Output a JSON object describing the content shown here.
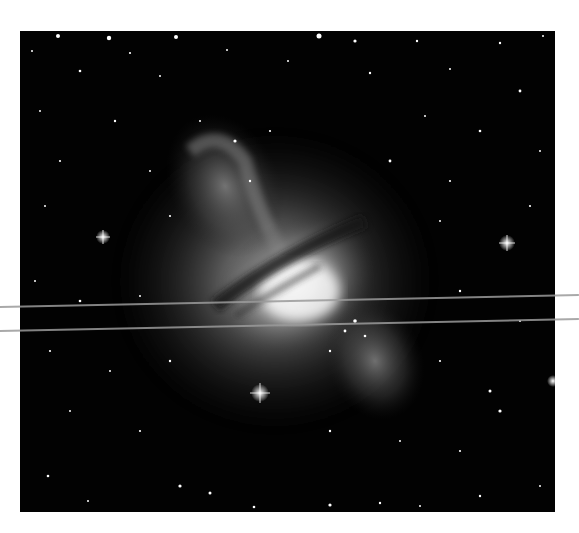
{
  "image": {
    "subject": "Centaurus A galaxy (NGC 5128) with dark dust lane and bright diffuse lobes against a star field",
    "palette": {
      "background": "#ffffff",
      "sky": "#020202",
      "glow": "#e8e8e8",
      "dust_lane": "#1a1a1a",
      "scanline": "#9a9a9a"
    },
    "bright_stars": [
      {
        "x": 103,
        "y": 237
      },
      {
        "x": 507,
        "y": 243
      },
      {
        "x": 260,
        "y": 393
      },
      {
        "x": 553,
        "y": 381
      }
    ],
    "artifacts": {
      "scanlines": [
        {
          "y_left": 307,
          "y_right": 295
        },
        {
          "y_left": 331,
          "y_right": 319
        }
      ]
    }
  }
}
